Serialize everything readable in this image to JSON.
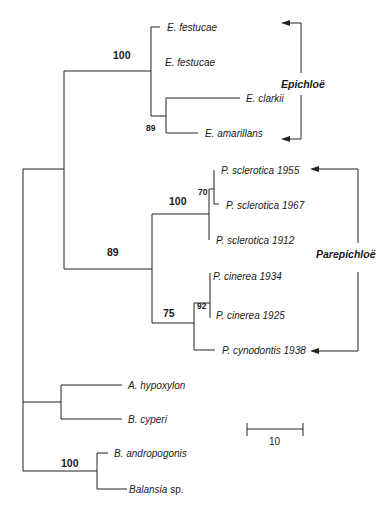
{
  "figure_type": "phylogenetic tree",
  "taxa": [
    {
      "id": "efest1",
      "genus": "E.",
      "epithet": "festucae",
      "suffix": ""
    },
    {
      "id": "efest2",
      "genus": "E.",
      "epithet": "festucae",
      "suffix": ""
    },
    {
      "id": "eclark",
      "genus": "E.",
      "epithet": "clarkii",
      "suffix": ""
    },
    {
      "id": "eamar",
      "genus": "E.",
      "epithet": "amarillans",
      "suffix": ""
    },
    {
      "id": "ps1955",
      "genus": "P.",
      "epithet": "sclerotica 1955",
      "suffix": ""
    },
    {
      "id": "ps1967",
      "genus": "P.",
      "epithet": "sclerotica 1967",
      "suffix": ""
    },
    {
      "id": "ps1912",
      "genus": "P.",
      "epithet": "sclerotica 1912",
      "suffix": ""
    },
    {
      "id": "pc1934",
      "genus": "P.",
      "epithet": "cinerea 1934",
      "suffix": ""
    },
    {
      "id": "pc1925",
      "genus": "P.",
      "epithet": "cinerea 1925",
      "suffix": ""
    },
    {
      "id": "pcyn",
      "genus": "P.",
      "epithet": "cynodontis 1938",
      "suffix": ""
    },
    {
      "id": "ahyp",
      "genus": "A.",
      "epithet": "hypoxylon",
      "suffix": ""
    },
    {
      "id": "bcyp",
      "genus": "B.",
      "epithet": "cyperi",
      "suffix": ""
    },
    {
      "id": "band",
      "genus": "B.",
      "epithet": "andropogonis",
      "suffix": ""
    },
    {
      "id": "bal",
      "genus": "Balansia",
      "epithet": "",
      "suffix": "sp."
    }
  ],
  "labels": {
    "efest1": "E. festucae",
    "efest2": "E. festucae",
    "eclark": "E. clarkii",
    "eamar": "E. amarillans",
    "ps1955": "P. sclerotica 1955",
    "ps1967": "P. sclerotica 1967",
    "ps1912": "P. sclerotica 1912",
    "pc1934": "P. cinerea 1934",
    "pc1925": "P. cinerea 1925",
    "pcyn": "P. cynodontis 1938",
    "ahyp": "A. hypoxylon",
    "bcyp": "B. cyperi",
    "band": "B. andropogonis",
    "bal_genus": "Balansia",
    "bal_sp": "sp."
  },
  "bootstrap": {
    "epichloe_clade": "100",
    "clarkii_amarillans": "89",
    "epi_pare": "89",
    "sclerotica": "100",
    "sclerotica_1955_1967": "70",
    "cinerea_cynodontis": "75",
    "cinerea": "92",
    "balansia": "100"
  },
  "groups": {
    "epichloe": "Epichloë",
    "parepichloe": "Parepichloë"
  },
  "scale_bar": {
    "label": "10"
  }
}
